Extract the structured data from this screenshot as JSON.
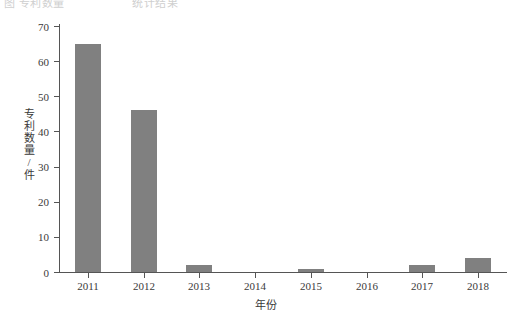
{
  "top_caption": {
    "fragment_left": "图 专利数量",
    "fragment_right": "统计结果"
  },
  "chart_data": {
    "type": "bar",
    "title": "",
    "xlabel": "年份",
    "ylabel": "专利数量/件",
    "categories": [
      "2011",
      "2012",
      "2013",
      "2014",
      "2015",
      "2016",
      "2017",
      "2018"
    ],
    "values": [
      65,
      46,
      2,
      0,
      1,
      0,
      2,
      4
    ],
    "ylim": [
      0,
      70
    ],
    "yticks": [
      0,
      10,
      20,
      30,
      40,
      50,
      60,
      70
    ],
    "ytick_labels": [
      "0",
      "10",
      "20",
      "30",
      "40",
      "50",
      "60",
      "70"
    ],
    "grid": false,
    "legend": null,
    "bar_color": "#808080",
    "axis_color": "#555555",
    "background": "#ffffff"
  }
}
